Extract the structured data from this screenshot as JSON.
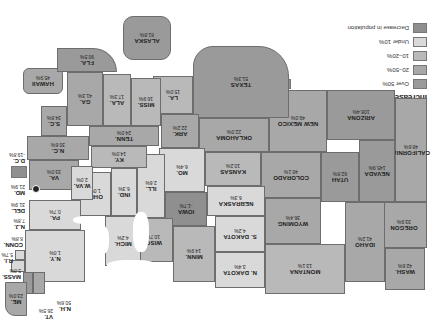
{
  "orientation": "rotated-180",
  "legend": {
    "title": "Increase in population",
    "items": [
      {
        "key": "over50",
        "label": "Over 50%",
        "color": "#9a9a9a"
      },
      {
        "key": "20to50",
        "label": "20–50%",
        "color": "#a8a8a8"
      },
      {
        "key": "10to20",
        "label": "10–20%",
        "color": "#b9b9b9"
      },
      {
        "key": "under10",
        "label": "Under 10%",
        "color": "#d9d9d9"
      },
      {
        "key": "decrease",
        "label": "Decrease in population",
        "color": "#8f8f8f"
      }
    ]
  },
  "national_average": {
    "title": "National average",
    "label": "22.5% increase",
    "color": "#8f8f8f"
  },
  "states": {
    "wash": {
      "name": "WASH.",
      "value": "42.6%"
    },
    "oregon": {
      "name": "OREGON",
      "value": "33.9%"
    },
    "california": {
      "name": "CALIFORNIA",
      "value": "48.6%"
    },
    "nevada": {
      "name": "NEVADA",
      "value": "145.9%"
    },
    "idaho": {
      "name": "IDAHO",
      "value": "41.2%"
    },
    "utah": {
      "name": "UTAH",
      "value": "62.8%"
    },
    "arizona": {
      "name": "ARIZONA",
      "value": "108.4%"
    },
    "montana": {
      "name": "MONTANA",
      "value": "13.1%"
    },
    "wyoming": {
      "name": "WYOMING",
      "value": "36.4%"
    },
    "colorado": {
      "name": "COLORADO",
      "value": "48.1%"
    },
    "new_mexico": {
      "name": "NEW MEXICO",
      "value": "49.0%"
    },
    "n_dakota": {
      "name": "N. DAKOTA",
      "value": "3.4%"
    },
    "s_dakota": {
      "name": "S. DAKOTA",
      "value": "4.2%"
    },
    "nebraska": {
      "name": "NEBRASKA",
      "value": "6.3%"
    },
    "kansas": {
      "name": "KANSAS",
      "value": "10.2%"
    },
    "oklahoma": {
      "name": "OKLAHOMA",
      "value": "22.0%"
    },
    "texas": {
      "name": "TEXAS",
      "value": "51.3%"
    },
    "minn": {
      "name": "MINN.",
      "value": "14.9%"
    },
    "iowa": {
      "name": "IOWA",
      "value": "-1.7%"
    },
    "mo": {
      "name": "MO.",
      "value": "6.4%"
    },
    "ark": {
      "name": "ARK.",
      "value": "22.2%"
    },
    "la": {
      "name": "LA.",
      "value": "15.0%"
    },
    "wisc": {
      "name": "WISC.",
      "value": "10.7%"
    },
    "ill": {
      "name": "ILL.",
      "value": "2.6%"
    },
    "mich": {
      "name": "MICH.",
      "value": "4.2%"
    },
    "ind": {
      "name": "IND.",
      "value": "6.3%"
    },
    "ohio": {
      "name": "OHIO",
      "value": "1.0%"
    },
    "ky": {
      "name": "KY.",
      "value": "14.0%"
    },
    "tenn": {
      "name": "TENN.",
      "value": "24.0%"
    },
    "miss": {
      "name": "MISS.",
      "value": "16.9%"
    },
    "ala": {
      "name": "ALA.",
      "value": "17.3%"
    },
    "ga": {
      "name": "GA.",
      "value": "41.3%"
    },
    "fla": {
      "name": "FLA.",
      "value": "90.5%"
    },
    "sc": {
      "name": "S.C.",
      "value": "34.8%"
    },
    "nc": {
      "name": "N.C.",
      "value": "30.6%"
    },
    "va": {
      "name": "VA.",
      "value": "33.0%"
    },
    "wva": {
      "name": "W.VA.",
      "value": "2.0%"
    },
    "pa": {
      "name": "PA.",
      "value": "0.7%"
    },
    "ny": {
      "name": "N.Y.",
      "value": "1.0%"
    },
    "vt": {
      "name": "VT.",
      "value": "26.5%"
    },
    "nh": {
      "name": "N.H.",
      "value": "50.6%"
    },
    "me": {
      "name": "ME.",
      "value": "23.0%"
    },
    "mass": {
      "name": "MASS.",
      "value": "5.8%"
    },
    "ri": {
      "name": "R.I.",
      "value": "5.7%"
    },
    "conn": {
      "name": "CONN.",
      "value": "8.8%"
    },
    "nj": {
      "name": "N.J.",
      "value": "7.8%"
    },
    "del": {
      "name": "DEL.",
      "value": "31.9%"
    },
    "md": {
      "name": "MD.",
      "value": "21.9%"
    },
    "dc": {
      "name": "D.C.",
      "value": "-19.8%"
    },
    "alaska": {
      "name": "ALASKA",
      "value": "81.8%"
    },
    "hawaii": {
      "name": "HAWAII",
      "value": "45.9%"
    }
  }
}
